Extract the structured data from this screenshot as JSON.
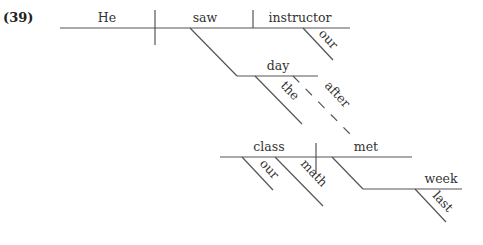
{
  "example_number": "(39)",
  "words": {
    "subject": "He",
    "verb": "saw",
    "object": "instructor",
    "object_modifier": "our",
    "adverbial_noun": "day",
    "adverbial_noun_modifier": "the",
    "conjunction": "after",
    "clause_subject": "class",
    "clause_subject_modifier_1": "our",
    "clause_subject_modifier_2": "math",
    "clause_verb": "met",
    "clause_adverbial_noun": "week",
    "clause_adverbial_noun_modifier": "last"
  },
  "colors": {
    "line": "#555555",
    "text": "#333333"
  }
}
